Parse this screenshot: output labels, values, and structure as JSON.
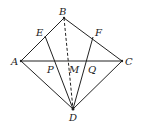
{
  "diagram": {
    "type": "geometry",
    "points": {
      "A": {
        "label": "A",
        "x": 21,
        "y": 61
      },
      "B": {
        "label": "B",
        "x": 64,
        "y": 18
      },
      "C": {
        "label": "C",
        "x": 122,
        "y": 61
      },
      "D": {
        "label": "D",
        "x": 73,
        "y": 109
      },
      "E": {
        "label": "E",
        "x": 45,
        "y": 36
      },
      "F": {
        "label": "F",
        "x": 93,
        "y": 37
      },
      "P": {
        "label": "P",
        "x": 56,
        "y": 61
      },
      "M": {
        "label": "M",
        "x": 68,
        "y": 61
      },
      "Q": {
        "label": "Q",
        "x": 88,
        "y": 61
      }
    },
    "solid_segments": [
      "AB",
      "BC",
      "AC",
      "AD",
      "CD",
      "ED",
      "FD"
    ],
    "dashed_segments": [
      "BD"
    ],
    "stroke_color": "#222222",
    "background": "#ffffff"
  }
}
